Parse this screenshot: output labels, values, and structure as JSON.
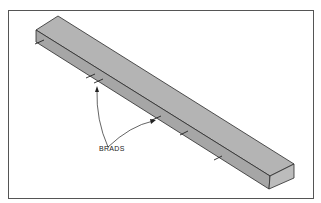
{
  "figure": {
    "callout_label": "BRADS",
    "colors": {
      "board_top": "#b4b4b4",
      "board_side": "#a6a6a6",
      "board_end": "#bcbcbc",
      "outline": "#2a2a2a",
      "frame": "#555555",
      "background": "#ffffff"
    }
  }
}
